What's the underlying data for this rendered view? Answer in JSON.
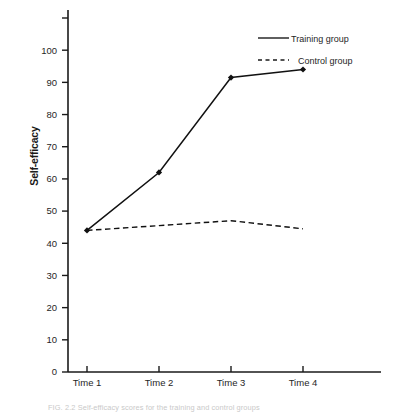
{
  "chart_data": {
    "type": "line",
    "title": "",
    "xlabel": "",
    "ylabel": "Self-efficacy",
    "categories": [
      "Time 1",
      "Time 2",
      "Time 3",
      "Time 4"
    ],
    "ylim": [
      0,
      110
    ],
    "ytick_values": [
      0,
      10,
      20,
      30,
      40,
      50,
      60,
      70,
      80,
      90,
      100,
      110
    ],
    "ytick_labels": [
      "0",
      "10",
      "20",
      "30",
      "40",
      "50",
      "60",
      "70",
      "80",
      "90",
      "100",
      ""
    ],
    "grid": false,
    "legend_position": "top-right",
    "series": [
      {
        "name": "Training group",
        "style": "solid",
        "marker": "diamond",
        "color": "#111111",
        "values": [
          44,
          62,
          91.5,
          94
        ]
      },
      {
        "name": "Control group",
        "style": "dashed",
        "marker": "none",
        "color": "#111111",
        "values": [
          44,
          45.5,
          47,
          44.5
        ]
      }
    ]
  },
  "legend": {
    "items": [
      {
        "label": "Training group",
        "style": "solid"
      },
      {
        "label": "Control group",
        "style": "dashed"
      }
    ]
  },
  "caption": {
    "text": "FIG. 2.2   Self-efficacy scores for the training and control groups"
  }
}
